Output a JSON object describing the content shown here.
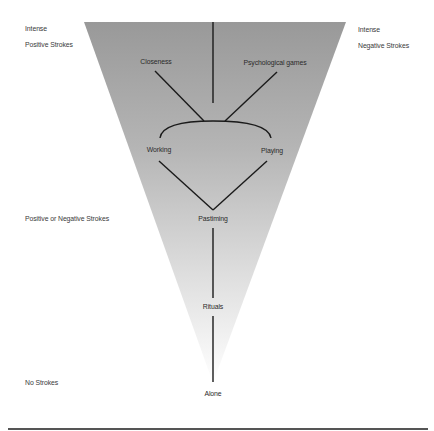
{
  "scale_labels": {
    "top_left_line1": "Intense",
    "top_left_line2": "Positive Strokes",
    "top_right_line1": "Intense",
    "top_right_line2": "Negative Strokes",
    "middle_left": "Positive or Negative Strokes",
    "bottom_left": "No Strokes"
  },
  "nodes": {
    "closeness": "Closeness",
    "psychological_games": "Psychological games",
    "working": "Working",
    "playing": "Playing",
    "pastiming": "Pastiming",
    "rituals": "Rituals",
    "alone": "Alone"
  },
  "colors": {
    "triangle_top": "#999999",
    "triangle_bottom": "#ffffff",
    "line": "#1a1a1a",
    "rule": "#555555"
  }
}
